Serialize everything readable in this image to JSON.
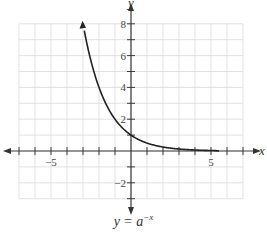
{
  "chart_data": {
    "type": "line",
    "title": "",
    "caption": "y = a^-x",
    "caption_base": "y = a",
    "caption_exp": "−x",
    "xlabel": "x",
    "ylabel": "y",
    "xlim": [
      -7,
      7
    ],
    "ylim": [
      -3,
      8
    ],
    "grid": true,
    "x_tick_labels": [
      "−5",
      "5"
    ],
    "y_tick_labels": [
      "8",
      "6",
      "4",
      "2",
      "−2"
    ],
    "series": [
      {
        "name": "y = a^-x (a = 2)",
        "x": [
          -3,
          -2.5,
          -2,
          -1.5,
          -1,
          -0.5,
          0,
          1,
          2,
          3,
          4,
          5,
          6,
          7
        ],
        "y": [
          8,
          5.66,
          4,
          2.83,
          2,
          1.41,
          1,
          0.5,
          0.25,
          0.125,
          0.0625,
          0.03,
          0.016,
          0.008
        ]
      }
    ],
    "curve_color": "#222222",
    "grid_color": "#d9d9d9"
  }
}
